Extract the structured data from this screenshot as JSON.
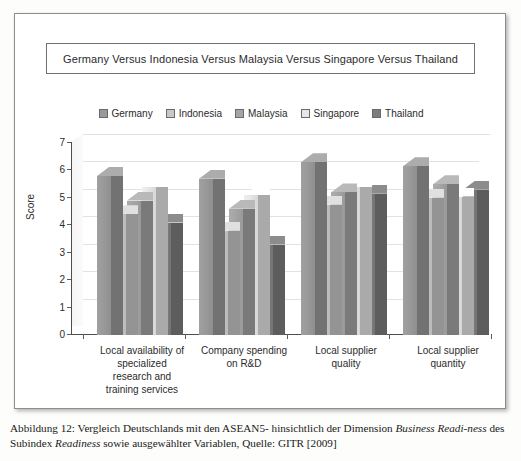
{
  "figure": {
    "caption_line1_a": "Abbildung 12: Vergleich Deutschlands mit den ASEAN5- hinsichtlich der Dimension ",
    "caption_line1_italic": "Business Readi-",
    "caption_line2_italic_a": "ness",
    "caption_line2_b": " des Subindex ",
    "caption_line2_italic_b": "Readiness",
    "caption_line2_c": " sowie ausgewählter Variablen, Quelle: GITR [2009]"
  },
  "chart_data": {
    "type": "bar",
    "title": "Germany Versus Indonesia Versus Malaysia Versus Singapore Versus Thailand",
    "xlabel": "",
    "ylabel": "Score",
    "ylim": [
      0,
      7
    ],
    "yticks": [
      0,
      1,
      2,
      3,
      4,
      5,
      6,
      7
    ],
    "grid": true,
    "legend_position": "top",
    "categories": [
      "Local availability of specialized research and training services",
      "Company spending on R&D",
      "Local supplier quality",
      "Local supplier quantity"
    ],
    "category_lines": [
      [
        "Local availability of",
        "specialized",
        "research and",
        "training services"
      ],
      [
        "Company spending",
        "on R&D"
      ],
      [
        "Local supplier",
        "quality"
      ],
      [
        "Local supplier",
        "quantity"
      ]
    ],
    "series": [
      {
        "name": "Germany",
        "color": "#9a9a9a",
        "values": [
          5.8,
          5.7,
          6.3,
          6.15
        ]
      },
      {
        "name": "Indonesia",
        "color": "#c8c8c8",
        "values": [
          4.4,
          3.8,
          4.75,
          5.0
        ]
      },
      {
        "name": "Malaysia",
        "color": "#a5a5a5",
        "values": [
          4.9,
          4.6,
          5.2,
          5.5
        ]
      },
      {
        "name": "Singapore",
        "color": "#e6e6e6",
        "values": [
          5.4,
          5.1,
          5.4,
          5.05
        ]
      },
      {
        "name": "Thailand",
        "color": "#7d7d7d",
        "values": [
          4.1,
          3.3,
          5.15,
          5.3
        ]
      }
    ]
  }
}
